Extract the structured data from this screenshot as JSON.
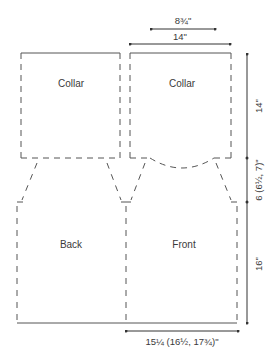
{
  "diagram": {
    "line_color": "#555555",
    "text_color": "#3a3a3a",
    "pieces": [
      {
        "id": "collar-back",
        "label": "Collar"
      },
      {
        "id": "collar-front",
        "label": "Collar"
      },
      {
        "id": "back",
        "label": "Back"
      },
      {
        "id": "front",
        "label": "Front"
      }
    ],
    "dimensions": {
      "neck_width": "8¾\"",
      "collar_width": "14\"",
      "collar_height": "14\"",
      "yoke_height": "6 (6½, 7)\"",
      "body_height": "16\"",
      "body_width": "15¼ (16½, 17¾)\""
    }
  }
}
